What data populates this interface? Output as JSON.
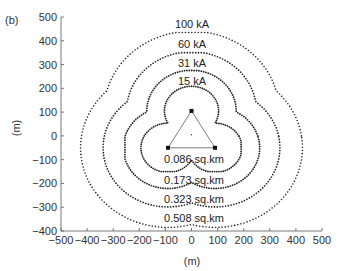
{
  "chart_data": {
    "type": "scatter",
    "panel_label": "(b)",
    "title": "",
    "xlabel": "(m)",
    "ylabel": "(m)",
    "xlim": [
      -500,
      500
    ],
    "ylim": [
      -400,
      500
    ],
    "xticks": [
      -500,
      -400,
      -300,
      -200,
      -100,
      0,
      100,
      200,
      300,
      400,
      500
    ],
    "yticks": [
      -400,
      -300,
      -200,
      -100,
      0,
      100,
      200,
      300,
      400,
      500
    ],
    "grid": false,
    "legend": "none (inline contour labels)",
    "triangle_vertices": [
      [
        0,
        105
      ],
      [
        -90,
        -50
      ],
      [
        90,
        -50
      ]
    ],
    "center_point": [
      0,
      5
    ],
    "series": [
      {
        "name": "15 kA",
        "area_label": "0.086 sq.km",
        "extent": {
          "top": 210,
          "bottom": -150,
          "left": -195,
          "right": 190
        },
        "style": "dotted-dense"
      },
      {
        "name": "31 kA",
        "area_label": "0.173 sq.km",
        "extent": {
          "top": 275,
          "bottom": -225,
          "left": -255,
          "right": 270
        },
        "style": "dotted-dense"
      },
      {
        "name": "60 kA",
        "area_label": "0.323 sq.km",
        "extent": {
          "top": 350,
          "bottom": -310,
          "left": -340,
          "right": 345
        },
        "style": "dotted"
      },
      {
        "name": "100 kA",
        "area_label": "0.508 sq.km",
        "extent": {
          "top": 435,
          "bottom": -385,
          "left": -425,
          "right": 435
        },
        "style": "dotted-sparse"
      }
    ]
  },
  "labels": {
    "panel": "(b)",
    "xlabel": "(m)",
    "ylabel": "(m)",
    "current": [
      "15 kA",
      "31 kA",
      "60 kA",
      "100 kA"
    ],
    "area": [
      "0.086 sq.km",
      "0.173 sq.km",
      "0.323 sq.km",
      "0.508 sq.km"
    ]
  },
  "colors": {
    "axis": "#555555",
    "contour": "#222222",
    "triangle": "#444444",
    "text": "#333333"
  }
}
